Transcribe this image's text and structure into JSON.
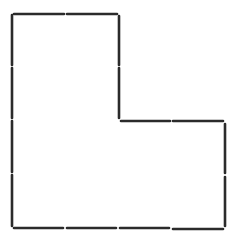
{
  "diagram": {
    "stroke_color": "#2b2b2b",
    "background": "#ffffff",
    "stroke_width": 2.6,
    "sticks": [
      {
        "id": "top-1",
        "x1": 14,
        "y1": 14,
        "x2": 64,
        "y2": 14
      },
      {
        "id": "top-2",
        "x1": 67,
        "y1": 14,
        "x2": 117,
        "y2": 14
      },
      {
        "id": "inner-vert-1",
        "x1": 119,
        "y1": 16,
        "x2": 119,
        "y2": 65
      },
      {
        "id": "inner-vert-2",
        "x1": 119,
        "y1": 68,
        "x2": 119,
        "y2": 118
      },
      {
        "id": "inner-horiz-1",
        "x1": 121,
        "y1": 121,
        "x2": 170,
        "y2": 121
      },
      {
        "id": "inner-horiz-2",
        "x1": 173,
        "y1": 121,
        "x2": 223,
        "y2": 121
      },
      {
        "id": "right-1",
        "x1": 225,
        "y1": 124,
        "x2": 225,
        "y2": 173
      },
      {
        "id": "right-2",
        "x1": 225,
        "y1": 177,
        "x2": 225,
        "y2": 226
      },
      {
        "id": "bottom-1",
        "x1": 14,
        "y1": 228,
        "x2": 63,
        "y2": 228
      },
      {
        "id": "bottom-2",
        "x1": 67,
        "y1": 228,
        "x2": 116,
        "y2": 228
      },
      {
        "id": "bottom-3",
        "x1": 120,
        "y1": 228,
        "x2": 169,
        "y2": 228
      },
      {
        "id": "bottom-4",
        "x1": 173,
        "y1": 229,
        "x2": 223,
        "y2": 229
      },
      {
        "id": "left-1",
        "x1": 12,
        "y1": 15,
        "x2": 12,
        "y2": 65
      },
      {
        "id": "left-2",
        "x1": 12,
        "y1": 68,
        "x2": 12,
        "y2": 118
      },
      {
        "id": "left-3",
        "x1": 12,
        "y1": 121,
        "x2": 12,
        "y2": 172
      },
      {
        "id": "left-4",
        "x1": 12,
        "y1": 175,
        "x2": 12,
        "y2": 226
      }
    ]
  }
}
